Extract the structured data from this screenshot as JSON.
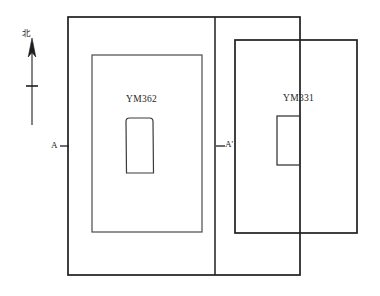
{
  "figure": {
    "type": "archaeological-tomb-plan",
    "background_color": "#ffffff",
    "line_color": "#1f1f1f"
  },
  "orientation": {
    "north_marker": "北",
    "arrow_direction": "up",
    "name": "north-arrow"
  },
  "tombs": [
    {
      "id": "YM362",
      "label": "YM362",
      "position": "left",
      "outer_pit": {
        "x": 92,
        "y": 55,
        "width": 110,
        "height": 177
      },
      "chamber_shape": "rounded-tapered",
      "chamber": {
        "x": 126,
        "y": 118,
        "width": 27,
        "height": 55
      }
    },
    {
      "id": "YM331",
      "label": "YM331",
      "position": "right",
      "outer_pit": {
        "x": 235,
        "y": 40,
        "width": 122,
        "height": 193
      },
      "chamber_shape": "rectangle",
      "chamber": {
        "x": 277,
        "y": 116,
        "width": 23,
        "height": 49
      }
    }
  ],
  "section_line": {
    "name": "A-A'",
    "start_label": "A",
    "end_label": "A'",
    "tick_y": 146
  },
  "enclosure": {
    "name": "outer-boundary",
    "x": 68,
    "y": 17,
    "width": 232,
    "height": 258,
    "divider_x": 215
  }
}
